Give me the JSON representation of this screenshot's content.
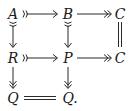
{
  "diagram": {
    "type": "commutative-diagram",
    "nodes": {
      "A": {
        "label": "A",
        "row": 0,
        "col": 0
      },
      "B": {
        "label": "B",
        "row": 0,
        "col": 1
      },
      "C_top": {
        "label": "C",
        "row": 0,
        "col": 2
      },
      "R": {
        "label": "R",
        "row": 1,
        "col": 0
      },
      "P": {
        "label": "P",
        "row": 1,
        "col": 1
      },
      "C_mid": {
        "label": "C",
        "row": 1,
        "col": 2
      },
      "Q_left": {
        "label": "Q",
        "row": 2,
        "col": 0
      },
      "Q_mid": {
        "label": "Q.",
        "row": 2,
        "col": 1
      }
    },
    "edges": [
      {
        "from": "A",
        "to": "B",
        "style": "monomorphism"
      },
      {
        "from": "B",
        "to": "C_top",
        "style": "epimorphism"
      },
      {
        "from": "A",
        "to": "R",
        "style": "monomorphism"
      },
      {
        "from": "B",
        "to": "P",
        "style": "monomorphism"
      },
      {
        "from": "C_top",
        "to": "C_mid",
        "style": "equality"
      },
      {
        "from": "R",
        "to": "P",
        "style": "monomorphism"
      },
      {
        "from": "P",
        "to": "C_mid",
        "style": "epimorphism"
      },
      {
        "from": "R",
        "to": "Q_left",
        "style": "epimorphism"
      },
      {
        "from": "P",
        "to": "Q_mid",
        "style": "epimorphism"
      },
      {
        "from": "Q_left",
        "to": "Q_mid",
        "style": "equality"
      }
    ]
  }
}
